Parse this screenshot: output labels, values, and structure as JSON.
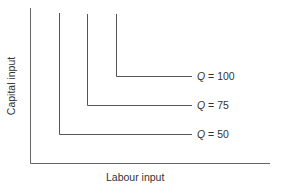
{
  "diagram": {
    "type": "isoquant-map (fixed proportions / L-shaped)",
    "axes": {
      "x_label": "Labour input",
      "y_label": "Capital input"
    },
    "isoquants": [
      {
        "q_symbol": "Q",
        "eq": "=",
        "value": "50",
        "label": "Q = 50"
      },
      {
        "q_symbol": "Q",
        "eq": "=",
        "value": "75",
        "label": "Q = 75"
      },
      {
        "q_symbol": "Q",
        "eq": "=",
        "value": "100",
        "label": "Q = 100"
      }
    ],
    "colors": {
      "line": "#555555",
      "text": "#333333",
      "background": "#ffffff"
    }
  }
}
